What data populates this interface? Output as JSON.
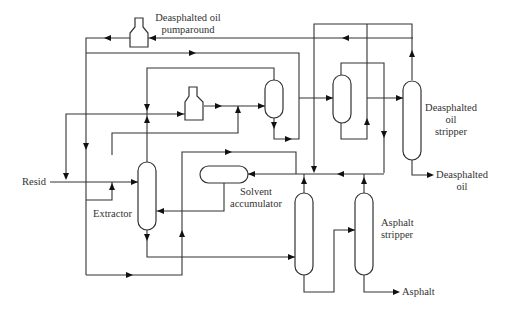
{
  "diagram": {
    "type": "process-flow-diagram",
    "labels": {
      "pumparound": [
        "Deasphalted oil",
        "pumparound"
      ],
      "resid": "Resid",
      "extractor": "Extractor",
      "solvent_accumulator": [
        "Solvent",
        "accumulator"
      ],
      "dao_stripper": [
        "Deasphalted",
        "oil",
        "stripper"
      ],
      "dao_product": [
        "Deasphalted",
        "oil"
      ],
      "asphalt_stripper": [
        "Asphalt",
        "stripper"
      ],
      "asphalt_product": "Asphalt"
    },
    "equipment": [
      {
        "id": "dao-pumparound-pump",
        "label": "Deasphalted oil pumparound"
      },
      {
        "id": "recycle-pump",
        "label": ""
      },
      {
        "id": "extractor",
        "label": "Extractor"
      },
      {
        "id": "dao-separator",
        "label": ""
      },
      {
        "id": "dao-flash-vessel",
        "label": ""
      },
      {
        "id": "dao-stripper",
        "label": "Deasphalted oil stripper"
      },
      {
        "id": "solvent-accumulator",
        "label": "Solvent accumulator"
      },
      {
        "id": "asphalt-flash-column",
        "label": ""
      },
      {
        "id": "asphalt-stripper",
        "label": "Asphalt stripper"
      }
    ],
    "streams": [
      {
        "from": "Resid",
        "to": "extractor"
      },
      {
        "from": "extractor",
        "to": "dao-separator"
      },
      {
        "from": "dao-separator",
        "to": "dao-flash-vessel"
      },
      {
        "from": "dao-flash-vessel",
        "to": "dao-stripper"
      },
      {
        "from": "dao-stripper",
        "to": "Deasphalted oil"
      },
      {
        "from": "extractor",
        "to": "asphalt-flash-column"
      },
      {
        "from": "asphalt-flash-column",
        "to": "asphalt-stripper"
      },
      {
        "from": "asphalt-stripper",
        "to": "Asphalt"
      },
      {
        "from": "solvent-accumulator",
        "to": "extractor"
      },
      {
        "from": "dao-pumparound-pump",
        "to": "extractor"
      }
    ],
    "colors": {
      "line": "#333333",
      "background": "#ffffff"
    }
  }
}
